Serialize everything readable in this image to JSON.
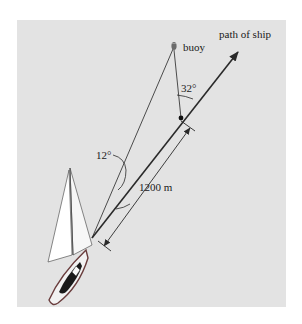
{
  "diagram": {
    "labels": {
      "path": "path of ship",
      "buoy": "buoy",
      "angle_at_point": "32°",
      "angle_at_ship": "12°",
      "distance": "1200 m"
    },
    "colors": {
      "background": "#ffffff",
      "panel": "#e3e3e3",
      "line": "#2a2a2a",
      "hull": "#8a4a4a"
    }
  }
}
